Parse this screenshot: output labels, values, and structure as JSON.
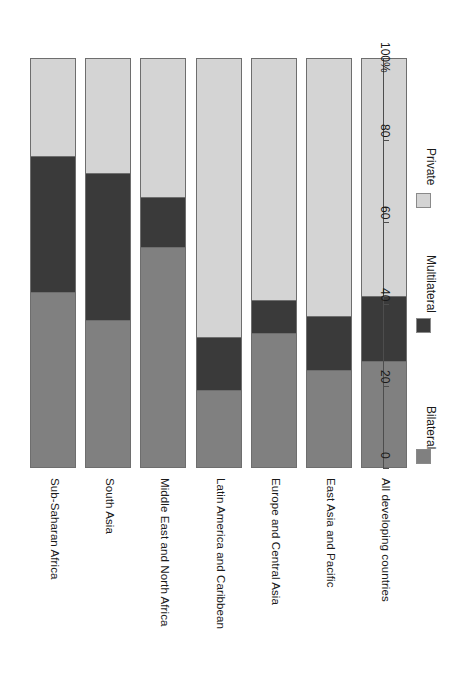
{
  "chart_data": {
    "type": "bar",
    "subtype": "stacked-bar-100-percent",
    "orientation": "rotated-90",
    "title": "",
    "subtitle": "",
    "xlabel": "",
    "ylabel": "",
    "ylim": [
      0,
      100
    ],
    "grid": false,
    "legend_position": "right",
    "axis_unit_suffix": "%",
    "categories": [
      "Sub-Saharan Africa",
      "South Asia",
      "Middle East and North Africa",
      "Latin America and Caribbean",
      "Europe and Central Asia",
      "East Asia and Pacific",
      "All developing countries"
    ],
    "series": [
      {
        "name": "Bilateral",
        "color": "#808080",
        "values": [
          43,
          36,
          54,
          19,
          33,
          24,
          26
        ]
      },
      {
        "name": "Multilateral",
        "color": "#3a3a3a",
        "values": [
          33,
          36,
          12,
          13,
          8,
          13,
          16
        ]
      },
      {
        "name": "Private",
        "color": "#d4d4d4",
        "values": [
          24,
          28,
          34,
          68,
          59,
          63,
          58
        ]
      }
    ],
    "tick_values": [
      0,
      20,
      40,
      60,
      80,
      100
    ],
    "tick_labels": [
      "0",
      "20",
      "40",
      "60",
      "80",
      "100%"
    ]
  },
  "legend": {
    "entries": [
      {
        "label": "Bilateral",
        "color": "#808080"
      },
      {
        "label": "Multilateral",
        "color": "#3a3a3a"
      },
      {
        "label": "Private",
        "color": "#d4d4d4"
      }
    ]
  }
}
